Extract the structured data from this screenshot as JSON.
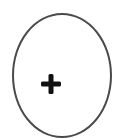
{
  "diagram": {
    "shape": "oval",
    "stroke_color": "#4a4a4a",
    "background": "#ffffff",
    "symbol": {
      "icon": "plus-icon",
      "glyph": "+",
      "color": "#111111"
    }
  }
}
